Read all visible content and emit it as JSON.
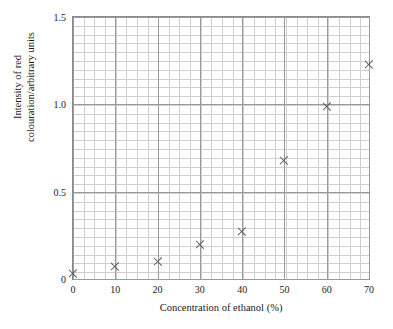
{
  "chart_data": {
    "type": "scatter",
    "title": "",
    "xlabel": "Concentration of ethanol (%)",
    "ylabel_line1": "Intensity of red",
    "ylabel_line2": "colouration/arbitrary units",
    "xlim": [
      0,
      70
    ],
    "ylim": [
      0,
      1.5
    ],
    "x_ticks": [
      0,
      10,
      20,
      30,
      40,
      50,
      60,
      70
    ],
    "x_tick_labels": [
      "0",
      "10",
      "20",
      "30",
      "40",
      "50",
      "60",
      "70"
    ],
    "y_ticks": [
      0,
      0.5,
      1.0,
      1.5
    ],
    "y_tick_labels": [
      "0",
      "0.5",
      "1.0",
      "1.5"
    ],
    "x_minor_step": 2.5,
    "y_minor_step": 0.05,
    "grid": true,
    "legend": null,
    "marker": "x-cross",
    "marker_color": "#555555",
    "axis_color": "#8a8a8a",
    "grid_color": "#cfcfcf",
    "points": [
      {
        "x": 0,
        "y": 0.03
      },
      {
        "x": 10,
        "y": 0.07
      },
      {
        "x": 20,
        "y": 0.1
      },
      {
        "x": 30,
        "y": 0.2
      },
      {
        "x": 40,
        "y": 0.27
      },
      {
        "x": 50,
        "y": 0.68
      },
      {
        "x": 60,
        "y": 0.99
      },
      {
        "x": 70,
        "y": 1.23
      }
    ]
  }
}
